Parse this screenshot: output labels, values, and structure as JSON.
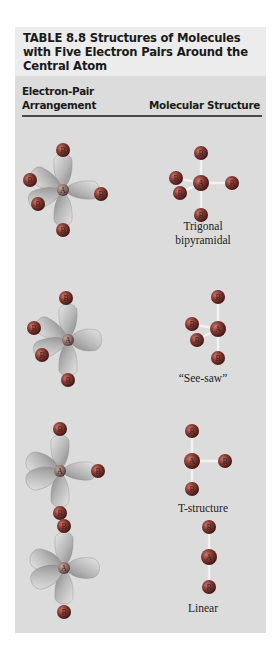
{
  "table": {
    "title": "TABLE 8.8    Structures of Molecules with Five Electron Pairs Around the Central Atom",
    "title_lines": [
      "TABLE 8.8    Structures of Molecules",
      "with Five Electron Pairs Around the",
      "Central Atom"
    ],
    "columns": {
      "left_line1": "Electron-Pair",
      "left_line2": "Arrangement",
      "right": "Molecular Structure"
    },
    "atom_labels": {
      "central": "A",
      "outer": "B"
    },
    "rows": [
      {
        "electron_pair_arrangement": "trigonal bipyramidal (5 bonding pairs)",
        "lone_pairs": 0,
        "molecular_structure": "Trigonal bipyramidal",
        "caption_lines": [
          "Trigonal",
          "bipyramidal"
        ]
      },
      {
        "electron_pair_arrangement": "trigonal bipyramidal (4 bonding, 1 lone pair)",
        "lone_pairs": 1,
        "molecular_structure": "“See-saw”",
        "caption_lines": [
          "“See-saw”"
        ]
      },
      {
        "electron_pair_arrangement": "trigonal bipyramidal (3 bonding, 2 lone pairs)",
        "lone_pairs": 2,
        "molecular_structure": "T-structure",
        "caption_lines": [
          "T-structure"
        ]
      },
      {
        "electron_pair_arrangement": "trigonal bipyramidal (2 bonding, 3 lone pairs)",
        "lone_pairs": 3,
        "molecular_structure": "Linear",
        "caption_lines": [
          "Linear"
        ]
      }
    ]
  },
  "colors": {
    "header_bg": "#ececec",
    "body_bg": "#dcdcdc",
    "rule": "#4a4a4a",
    "atom": "#8a3a32",
    "lobe": "#b8b8b8",
    "bond": "#f2f2f2"
  }
}
